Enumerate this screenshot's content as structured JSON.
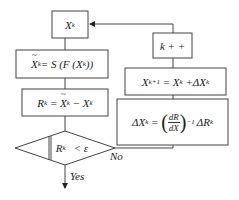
{
  "diagram": {
    "type": "flowchart",
    "nodes": {
      "init": {
        "var": "X",
        "sup": "k"
      },
      "solve": {
        "lhs_var": "X",
        "lhs_sup": "k",
        "eq": " = S (F (X",
        "sup": "k",
        "tail": "))"
      },
      "residual": {
        "lhs": "R",
        "lhs_sup": "k",
        "eq": " = ",
        "tvar": "X",
        "tsup": "k",
        "minus": " − X",
        "msup": "k"
      },
      "decision": {
        "pre": "‖R",
        "sup": "k",
        "post": "‖ < ε"
      },
      "increment": {
        "text": "k + +"
      },
      "update": {
        "lhs": "X",
        "lhs_sup": "k+1",
        "eq": " = X",
        "sup": "k",
        "plus": " +ΔX",
        "psup": "k"
      },
      "newton": {
        "lhs": "ΔX",
        "lhs_sup": "k",
        "eq": " = ",
        "num": "dR",
        "den": "dX",
        "exp": "−1",
        "rhs": "ΔR",
        "rsup": "k"
      }
    },
    "edge_labels": {
      "yes": "Yes",
      "no": "No"
    }
  }
}
